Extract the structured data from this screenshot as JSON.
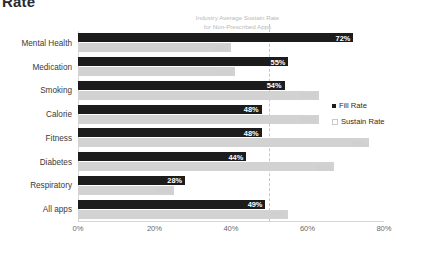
{
  "title_fragment": "Rate",
  "annotation": {
    "line1": "Industry Average Sustain Rate",
    "line2": "for Non-Prescribed Apps",
    "value": 50
  },
  "legend": {
    "position": "right",
    "fill_label": "Fill Rate",
    "sustain_label": "Sustain Rate"
  },
  "axis": {
    "ticks": [
      "0%",
      "20%",
      "40%",
      "60%",
      "80%"
    ],
    "tick_values": [
      0,
      20,
      40,
      60,
      80
    ],
    "min": 0,
    "max": 80
  },
  "colors": {
    "fill_bar": "#1c1c1c",
    "sustain_bar": "#d2d2d2",
    "fill_label": "#ffffff",
    "sustain_label": "#cfcfcf",
    "reference_line": "#c6c6c6",
    "annotation_text": "#b9b9b9",
    "axis": "#d7d7d7",
    "category_text": "#3a3a3a"
  },
  "chart_data": {
    "type": "bar",
    "orientation": "horizontal",
    "title": "Rate",
    "xlabel": "",
    "ylabel": "",
    "xlim": [
      0,
      80
    ],
    "grid": false,
    "legend_position": "right",
    "categories": [
      "Mental Health",
      "Medication",
      "Smoking",
      "Calorie",
      "Fitness",
      "Diabetes",
      "Respiratory",
      "All apps"
    ],
    "series": [
      {
        "name": "Fill Rate",
        "values": [
          72,
          55,
          54,
          48,
          48,
          44,
          28,
          49
        ],
        "labels": [
          "72%",
          "55%",
          "54%",
          "48%",
          "48%",
          "44%",
          "28%",
          "49%"
        ]
      },
      {
        "name": "Sustain Rate",
        "values": [
          40,
          41,
          63,
          63,
          76,
          67,
          25,
          55
        ],
        "labels": [
          "40%",
          "41%",
          "63%",
          "63%",
          "76%",
          "67%",
          "25%",
          "55%"
        ]
      }
    ],
    "annotations": [
      {
        "text": "Industry Average Sustain Rate for Non-Prescribed Apps",
        "value": 50,
        "type": "vertical-reference-line"
      }
    ]
  }
}
